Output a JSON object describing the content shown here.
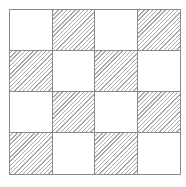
{
  "diagram": {
    "type": "checkerboard-grid",
    "rows": 4,
    "cols": 4,
    "border_color": "#8a8a8a",
    "hatch_color": "#a9a9a9",
    "fill_color": "#ffffff",
    "hatch_direction": "diagonal-up-right",
    "cells": [
      [
        "plain",
        "hatched",
        "plain",
        "hatched"
      ],
      [
        "hatched",
        "plain",
        "hatched",
        "plain"
      ],
      [
        "plain",
        "hatched",
        "plain",
        "hatched"
      ],
      [
        "hatched",
        "plain",
        "hatched",
        "plain"
      ]
    ]
  }
}
